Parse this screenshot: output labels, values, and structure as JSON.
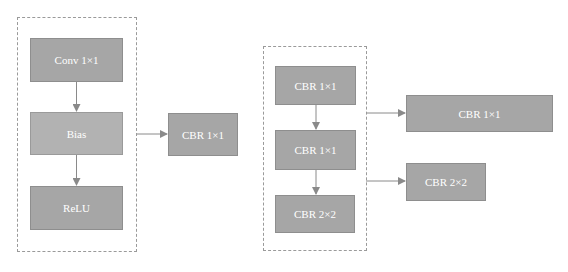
{
  "diagram": {
    "left_group": {
      "nodes": [
        {
          "id": "conv",
          "label": "Conv 1×1"
        },
        {
          "id": "bias",
          "label": "Bias"
        },
        {
          "id": "relu",
          "label": "ReLU"
        }
      ]
    },
    "middle_output": {
      "id": "cbr_mid",
      "label": "CBR 1×1"
    },
    "right_group": {
      "nodes": [
        {
          "id": "cbr_a",
          "label": "CBR 1×1"
        },
        {
          "id": "cbr_b",
          "label": "CBR 1×1"
        },
        {
          "id": "cbr_c",
          "label": "CBR 2×2"
        }
      ]
    },
    "right_outputs": [
      {
        "id": "cbr_out1",
        "label": "CBR 1×1"
      },
      {
        "id": "cbr_out2",
        "label": "CBR 2×2"
      }
    ],
    "edges": [
      {
        "from": "conv",
        "to": "bias"
      },
      {
        "from": "bias",
        "to": "relu"
      },
      {
        "from": "left_group",
        "to": "cbr_mid"
      },
      {
        "from": "cbr_a",
        "to": "cbr_b"
      },
      {
        "from": "cbr_b",
        "to": "cbr_c"
      },
      {
        "from": "right_group",
        "to": "cbr_out1"
      },
      {
        "from": "right_group",
        "to": "cbr_out2"
      }
    ],
    "colors": {
      "node_fill": "#a6a6a6",
      "node_fill_light": "#b2b2b2",
      "node_text": "#ffffff",
      "dashed_border": "#9a9a9a",
      "arrow": "#8a8a8a"
    }
  }
}
